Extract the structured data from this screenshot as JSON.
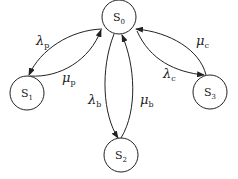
{
  "diagram": {
    "type": "state-transition",
    "nodes": [
      {
        "id": "S0",
        "base": "S",
        "sub": "0"
      },
      {
        "id": "S1",
        "base": "S",
        "sub": "1"
      },
      {
        "id": "S2",
        "base": "S",
        "sub": "2"
      },
      {
        "id": "S3",
        "base": "S",
        "sub": "3"
      }
    ],
    "edges": [
      {
        "from": "S0",
        "to": "S1",
        "symbol": "λ",
        "sub": "p"
      },
      {
        "from": "S1",
        "to": "S0",
        "symbol": "μ",
        "sub": "p"
      },
      {
        "from": "S0",
        "to": "S2",
        "symbol": "λ",
        "sub": "b"
      },
      {
        "from": "S2",
        "to": "S0",
        "symbol": "μ",
        "sub": "b"
      },
      {
        "from": "S0",
        "to": "S3",
        "symbol": "λ",
        "sub": "c"
      },
      {
        "from": "S3",
        "to": "S0",
        "symbol": "μ",
        "sub": "c"
      }
    ]
  }
}
